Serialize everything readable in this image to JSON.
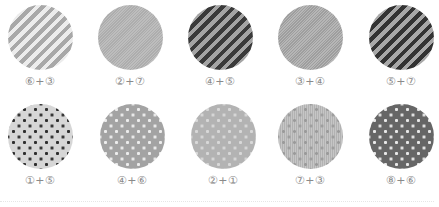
{
  "rows": [
    {
      "swatches": [
        {
          "label": "⑥+③",
          "pattern": "diagonal-stripes-light"
        },
        {
          "label": "②+⑦",
          "pattern": "fine-diagonal-hatch"
        },
        {
          "label": "④+⑤",
          "pattern": "diagonal-stripes-dark"
        },
        {
          "label": "③+④",
          "pattern": "fine-diagonal-hatch"
        },
        {
          "label": "⑤+⑦",
          "pattern": "diagonal-stripes-dark"
        }
      ]
    },
    {
      "swatches": [
        {
          "label": "①+⑤",
          "pattern": "dark-dots-on-light"
        },
        {
          "label": "④+⑥",
          "pattern": "white-dots-on-mid-gray"
        },
        {
          "label": "②+①",
          "pattern": "pale-dots-on-mid-gray"
        },
        {
          "label": "⑦+③",
          "pattern": "dots-on-vertical-lines"
        },
        {
          "label": "⑧+⑥",
          "pattern": "white-dots-on-dark-gray"
        }
      ]
    }
  ],
  "colors": {
    "label": "#8a8a8a",
    "stripe_dark": "#333333",
    "stripe_mid": "#a8a8a8",
    "stripe_light": "#ececec",
    "dot_base_dark": "#666666",
    "dot_base_light": "#d6d6d6"
  }
}
